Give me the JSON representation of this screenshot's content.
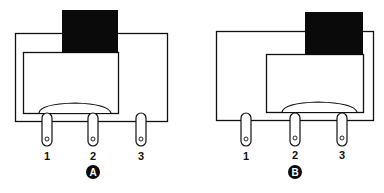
{
  "figure": {
    "panels": [
      {
        "id": "A",
        "badge": "A",
        "pins": [
          {
            "label": "1"
          },
          {
            "label": "2"
          },
          {
            "label": "3"
          }
        ]
      },
      {
        "id": "B",
        "badge": "B",
        "pins": [
          {
            "label": "1"
          },
          {
            "label": "2"
          },
          {
            "label": "3"
          }
        ]
      }
    ],
    "colors": {
      "stroke": "#111111",
      "fill_dark": "#0a0a0a",
      "background": "#ffffff"
    }
  }
}
